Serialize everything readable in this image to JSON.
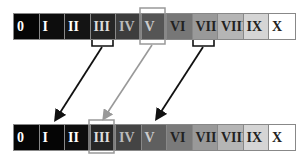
{
  "diagram": {
    "top_bar": {
      "cells": [
        {
          "label": "0",
          "bg": "#050505",
          "fg": "#ffffff"
        },
        {
          "label": "I",
          "bg": "#0d0d0d",
          "fg": "#ffffff"
        },
        {
          "label": "II",
          "bg": "#141414",
          "fg": "#ffffff"
        },
        {
          "label": "III",
          "bg": "#262626",
          "fg": "#dddddd"
        },
        {
          "label": "IV",
          "bg": "#3d3d3d",
          "fg": "#bbbbbb"
        },
        {
          "label": "V",
          "bg": "#555555",
          "fg": "#cccccc"
        },
        {
          "label": "VI",
          "bg": "#777777",
          "fg": "#222222"
        },
        {
          "label": "VII",
          "bg": "#999999",
          "fg": "#222222"
        },
        {
          "label": "VIII",
          "bg": "#b5b5b5",
          "fg": "#222222"
        },
        {
          "label": "IX",
          "bg": "#d5d5d5",
          "fg": "#222222"
        },
        {
          "label": "X",
          "bg": "#ffffff",
          "fg": "#222222"
        }
      ],
      "highlight_box_index": 5,
      "bracket_indices": [
        3,
        7
      ]
    },
    "bottom_bar": {
      "cells": [
        {
          "label": "0",
          "bg": "#050505",
          "fg": "#ffffff"
        },
        {
          "label": "I",
          "bg": "#050505",
          "fg": "#ffffff"
        },
        {
          "label": "II",
          "bg": "#0d0d0d",
          "fg": "#ffffff"
        },
        {
          "label": "III",
          "bg": "#262626",
          "fg": "#dddddd"
        },
        {
          "label": "IV",
          "bg": "#444444",
          "fg": "#bbbbbb"
        },
        {
          "label": "V",
          "bg": "#5f5f5f",
          "fg": "#cccccc"
        },
        {
          "label": "VI",
          "bg": "#7a7a7a",
          "fg": "#222222"
        },
        {
          "label": "VII",
          "bg": "#999999",
          "fg": "#222222"
        },
        {
          "label": "VIII",
          "bg": "#b5b5b5",
          "fg": "#222222"
        },
        {
          "label": "IX",
          "bg": "#d5d5d5",
          "fg": "#222222"
        },
        {
          "label": "X",
          "bg": "#ffffff",
          "fg": "#222222"
        }
      ],
      "highlight_box_index": 3
    },
    "arrows": [
      {
        "from": "top III",
        "to": "bottom I",
        "color": "#111111"
      },
      {
        "from": "top V",
        "to": "bottom III",
        "color": "#999999"
      },
      {
        "from": "top VII",
        "to": "bottom V",
        "color": "#111111"
      }
    ]
  }
}
